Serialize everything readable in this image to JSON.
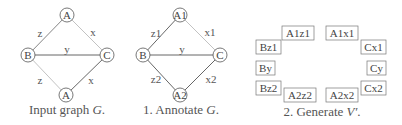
{
  "panels": [
    {
      "caption": "Input graph G.",
      "caption_prefix": "Input graph ",
      "caption_var": "G",
      "caption_suffix": ".",
      "nodes": [
        {
          "id": "top",
          "label": "A",
          "x": 67,
          "y": 15
        },
        {
          "id": "left",
          "label": "B",
          "x": 28,
          "y": 55
        },
        {
          "id": "right",
          "label": "C",
          "x": 107,
          "y": 55
        },
        {
          "id": "bottom",
          "label": "A",
          "x": 66,
          "y": 95
        }
      ],
      "edges": [
        {
          "from": "top",
          "to": "left",
          "label": "z",
          "lx": 40,
          "ly": 34
        },
        {
          "from": "top",
          "to": "right",
          "label": "x",
          "lx": 93,
          "ly": 34
        },
        {
          "from": "left",
          "to": "right",
          "label": "y",
          "lx": 67,
          "ly": 51
        },
        {
          "from": "left",
          "to": "bottom",
          "label": "z",
          "lx": 40,
          "ly": 82
        },
        {
          "from": "bottom",
          "to": "right",
          "label": "x",
          "lx": 91,
          "ly": 82
        }
      ]
    },
    {
      "caption": "1. Annotate G.",
      "caption_prefix": "1. Annotate ",
      "caption_var": "G",
      "caption_suffix": ".",
      "nodes": [
        {
          "id": "top",
          "label": "A1",
          "x": 180,
          "y": 15
        },
        {
          "id": "left",
          "label": "B",
          "x": 143,
          "y": 55
        },
        {
          "id": "right",
          "label": "C",
          "x": 220,
          "y": 55
        },
        {
          "id": "bottom",
          "label": "A2",
          "x": 180,
          "y": 95
        }
      ],
      "edges": [
        {
          "from": "top",
          "to": "left",
          "label": "z1",
          "lx": 157,
          "ly": 35
        },
        {
          "from": "top",
          "to": "right",
          "label": "x1",
          "lx": 210,
          "ly": 34
        },
        {
          "from": "left",
          "to": "right",
          "label": "y",
          "lx": 182,
          "ly": 52
        },
        {
          "from": "left",
          "to": "bottom",
          "label": "z2",
          "lx": 156,
          "ly": 79
        },
        {
          "from": "bottom",
          "to": "right",
          "label": "x2",
          "lx": 210,
          "ly": 80
        }
      ]
    },
    {
      "caption": "2. Generate V'.",
      "caption_prefix": "2. Generate ",
      "caption_var": "V′",
      "caption_suffix": ".",
      "boxes": [
        {
          "label": "A1z1",
          "x": 282,
          "y": 26,
          "w": 32,
          "h": 14
        },
        {
          "label": "A1x1",
          "x": 326,
          "y": 26,
          "w": 32,
          "h": 14
        },
        {
          "label": "Bz1",
          "x": 256,
          "y": 40,
          "w": 25,
          "h": 14
        },
        {
          "label": "Cx1",
          "x": 361,
          "y": 40,
          "w": 25,
          "h": 14
        },
        {
          "label": "By",
          "x": 256,
          "y": 61,
          "w": 19,
          "h": 14
        },
        {
          "label": "Cy",
          "x": 367,
          "y": 61,
          "w": 19,
          "h": 14
        },
        {
          "label": "Bz2",
          "x": 256,
          "y": 81,
          "w": 25,
          "h": 14
        },
        {
          "label": "Cx2",
          "x": 361,
          "y": 81,
          "w": 25,
          "h": 14
        },
        {
          "label": "A2z2",
          "x": 284,
          "y": 88,
          "w": 32,
          "h": 14
        },
        {
          "label": "A2x2",
          "x": 326,
          "y": 88,
          "w": 32,
          "h": 14
        }
      ]
    }
  ],
  "colors": {
    "edge_dark": "#555555",
    "edge_light": "#bbbbbb",
    "node_stroke": "#555555",
    "box_stroke": "#777777",
    "text": "#444444"
  }
}
